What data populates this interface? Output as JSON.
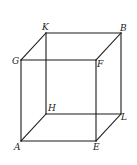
{
  "diagram": {
    "type": "cube",
    "colors": {
      "line": "#1a1a1a",
      "label": "#222222",
      "background": "#ffffff"
    },
    "vertices": {
      "K": {
        "x": 46,
        "y": 33,
        "label": "K"
      },
      "B": {
        "x": 121,
        "y": 33,
        "label": "B"
      },
      "G": {
        "x": 21,
        "y": 60,
        "label": "G"
      },
      "F": {
        "x": 96,
        "y": 60,
        "label": "F"
      },
      "H": {
        "x": 46,
        "y": 114,
        "label": "H"
      },
      "L": {
        "x": 121,
        "y": 114,
        "label": "L"
      },
      "A": {
        "x": 21,
        "y": 141,
        "label": "A"
      },
      "E": {
        "x": 96,
        "y": 141,
        "label": "E"
      }
    },
    "edges": [
      [
        "K",
        "B"
      ],
      [
        "G",
        "F"
      ],
      [
        "K",
        "G"
      ],
      [
        "B",
        "F"
      ],
      [
        "H",
        "L"
      ],
      [
        "A",
        "E"
      ],
      [
        "H",
        "A"
      ],
      [
        "L",
        "E"
      ],
      [
        "K",
        "H"
      ],
      [
        "B",
        "L"
      ],
      [
        "G",
        "A"
      ],
      [
        "F",
        "E"
      ]
    ]
  }
}
